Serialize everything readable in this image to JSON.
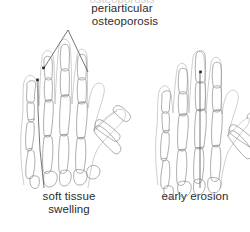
{
  "figure": {
    "type": "medical-line-illustration",
    "background_color": "#ffffff",
    "bone_line_color": "#8a8a8a",
    "skin_line_color": "#b9b9b9",
    "leader_line_color": "#3a3a3a",
    "text_color": "#2b2b2b"
  },
  "annotations": {
    "top_label": "periarticular\nosteoporosis",
    "top_label_clipped_above": "osteoporosis",
    "bottom_left_label": "soft tissue\nswelling",
    "bottom_right_label": "early erosion"
  },
  "panels": [
    {
      "id": "left-hand",
      "label": "soft tissue\nswelling",
      "pointer_label": "periarticular\nosteoporosis",
      "marker_count": 2
    },
    {
      "id": "right-hand",
      "label": "early erosion",
      "marker_count": 1
    }
  ]
}
